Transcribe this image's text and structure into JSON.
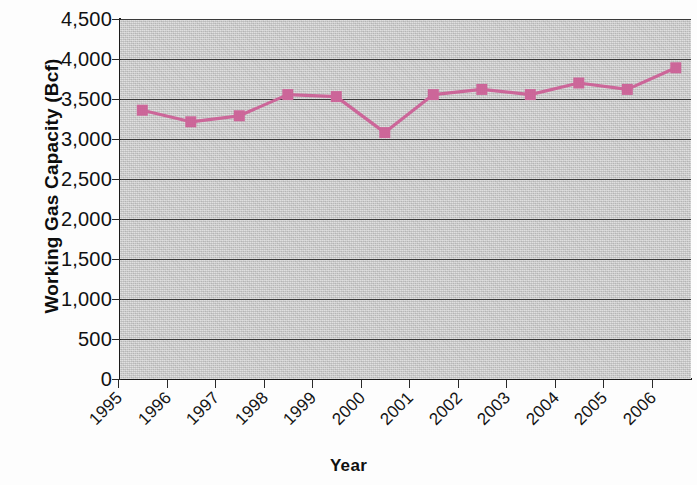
{
  "chart_data": {
    "type": "line",
    "title": "",
    "xlabel": "Year",
    "ylabel": "Working Gas Capacity (Bcf)",
    "categories": [
      "1995",
      "1996",
      "1997",
      "1998",
      "1999",
      "2000",
      "2001",
      "2002",
      "2003",
      "2004",
      "2005",
      "2006"
    ],
    "values": [
      3360,
      3215,
      3290,
      3555,
      3530,
      3080,
      3555,
      3620,
      3555,
      3700,
      3620,
      3890
    ],
    "series": [
      {
        "name": "Working Gas Capacity",
        "values": [
          3360,
          3215,
          3290,
          3555,
          3530,
          3080,
          3555,
          3620,
          3555,
          3700,
          3620,
          3890
        ]
      }
    ],
    "ylim": [
      0,
      4500
    ],
    "ytick_values": [
      0,
      500,
      1000,
      1500,
      2000,
      2500,
      3000,
      3500,
      4000,
      4500
    ],
    "ytick_labels": [
      "0",
      "500",
      "1,000",
      "1,500",
      "2,000",
      "2,500",
      "3,000",
      "3,500",
      "4,000",
      "4,500"
    ],
    "grid": "horizontal",
    "legend": "none",
    "series_color": "#cc6699",
    "marker": "square",
    "plot_background": "#c9c9c9",
    "gridline_color": "#3a3a3a",
    "axis_color": "#1b1b1b",
    "xtick_label_rotation": -45
  }
}
